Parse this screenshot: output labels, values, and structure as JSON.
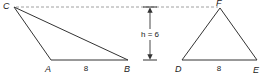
{
  "diagram": {
    "colors": {
      "stroke": "#333333",
      "dash": "#888888",
      "text": "#222222",
      "background": "#ffffff"
    },
    "triangle_left": {
      "vertices": {
        "C": "C",
        "A": "A",
        "B": "B"
      },
      "base_label": "8"
    },
    "triangle_right": {
      "vertices": {
        "F": "F",
        "D": "D",
        "E": "E"
      },
      "base_label": "8"
    },
    "height": {
      "label": "h = 6",
      "value": 6
    }
  }
}
